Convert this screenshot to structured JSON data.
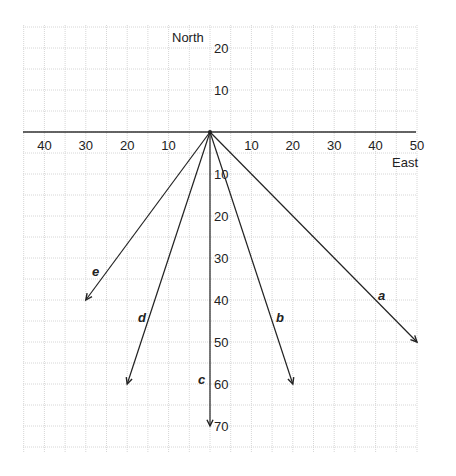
{
  "axes": {
    "north_label": "North",
    "east_label": "East",
    "x_ticks": [
      {
        "v": -40,
        "t": "40"
      },
      {
        "v": -30,
        "t": "30"
      },
      {
        "v": -20,
        "t": "20"
      },
      {
        "v": -10,
        "t": "10"
      },
      {
        "v": 10,
        "t": "10"
      },
      {
        "v": 20,
        "t": "20"
      },
      {
        "v": 30,
        "t": "30"
      },
      {
        "v": 40,
        "t": "40"
      },
      {
        "v": 50,
        "t": "50"
      }
    ],
    "y_ticks": [
      {
        "v": 20,
        "t": "20"
      },
      {
        "v": 10,
        "t": "10"
      },
      {
        "v": -10,
        "t": "10"
      },
      {
        "v": -20,
        "t": "20"
      },
      {
        "v": -30,
        "t": "30"
      },
      {
        "v": -40,
        "t": "40"
      },
      {
        "v": -50,
        "t": "50"
      },
      {
        "v": -60,
        "t": "60"
      },
      {
        "v": -70,
        "t": "70"
      }
    ]
  },
  "vectors": [
    {
      "name": "a",
      "x": 50,
      "y": -50
    },
    {
      "name": "b",
      "x": 20,
      "y": -60
    },
    {
      "name": "c",
      "x": 0,
      "y": -70
    },
    {
      "name": "d",
      "x": -20,
      "y": -60
    },
    {
      "name": "e",
      "x": -30,
      "y": -40
    }
  ]
}
